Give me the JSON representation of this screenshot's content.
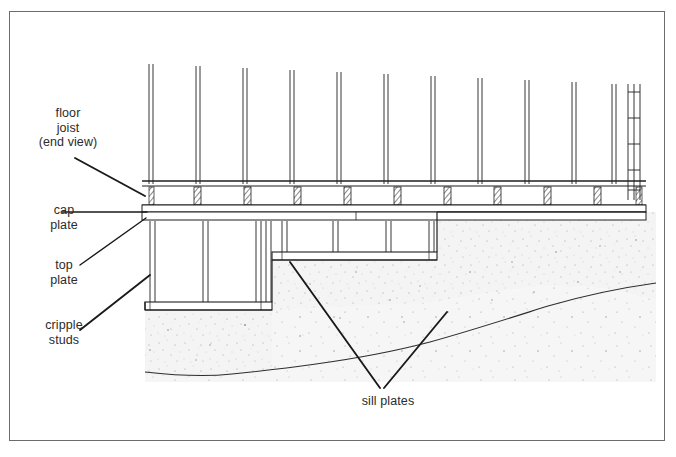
{
  "figure": {
    "type": "architectural-construction-detail",
    "border_color": "#6c6c70",
    "line_color": "#1a1a1a",
    "concrete_fill_color": "#f2f2f2",
    "background": "#ffffff"
  },
  "labels": [
    {
      "id": "floor-joist",
      "text": "floor\njoist\n(end view)"
    },
    {
      "id": "cap-plate",
      "text": "cap\nplate"
    },
    {
      "id": "top-plate",
      "text": "top\nplate"
    },
    {
      "id": "cripple-studs",
      "text": "cripple\nstuds"
    },
    {
      "id": "sill-plates",
      "text": "sill plates"
    }
  ],
  "leaders": [
    {
      "from_label": "floor-joist",
      "to_part": "floor-joist-band"
    },
    {
      "from_label": "cap-plate",
      "to_part": "cap-plate-band"
    },
    {
      "from_label": "top-plate",
      "to_part": "top-plate-band"
    },
    {
      "from_label": "cripple-studs",
      "to_part": "cripple-stud"
    },
    {
      "from_label": "sill-plates",
      "to_part": "upper-sill-plate"
    },
    {
      "from_label": "sill-plates",
      "to_part": "lower-sill-plate"
    }
  ],
  "components": {
    "upper_studs_count": 11,
    "corner_post_detail": "ladder-blocking",
    "floor_joists_count": 9,
    "cripple_studs_upper_count": 3,
    "cripple_studs_lower_count": 3,
    "foundation_steps": 2
  }
}
